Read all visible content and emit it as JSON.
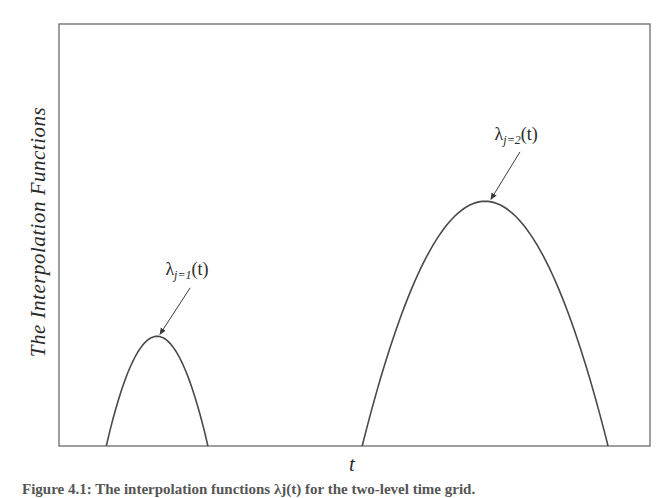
{
  "chart_data": {
    "type": "line",
    "title": "",
    "xlabel": "t",
    "ylabel": "The Interpolation Functions",
    "xlim": [
      0,
      10
    ],
    "ylim": [
      0,
      1
    ],
    "grid": false,
    "ticks": {
      "x": [],
      "y": []
    },
    "legend": null,
    "series": [
      {
        "name": "λ_{j=1}(t)",
        "shape": "parabola",
        "x_start": 0.8,
        "x_end": 2.52,
        "peak_x": 1.66,
        "peak_y": 0.26,
        "annotation": {
          "text_main": "λ",
          "text_sub": "j=1",
          "text_tail": "(t)",
          "label_x": 1.8,
          "label_y": 0.405,
          "arrow_from": [
            2.22,
            0.375
          ],
          "arrow_to": [
            1.71,
            0.265
          ]
        }
      },
      {
        "name": "λ_{j=2}(t)",
        "shape": "parabola",
        "x_start": 5.13,
        "x_end": 9.29,
        "peak_x": 7.21,
        "peak_y": 0.58,
        "annotation": {
          "text_main": "λ",
          "text_sub": "j=2",
          "text_tail": "(t)",
          "label_x": 7.37,
          "label_y": 0.725,
          "arrow_from": [
            7.8,
            0.697
          ],
          "arrow_to": [
            7.31,
            0.585
          ]
        }
      }
    ]
  },
  "plot": {
    "frame": {
      "left": 59,
      "top": 24,
      "right": 650,
      "bottom": 446
    },
    "line_color": "#4a4a4a",
    "frame_color": "#6a6a6a"
  },
  "labels": {
    "ylabel": "The Interpolation Functions",
    "xlabel": "t"
  },
  "caption": {
    "text": "Figure 4.1: The interpolation functions λj(t) for the two-level time grid."
  }
}
